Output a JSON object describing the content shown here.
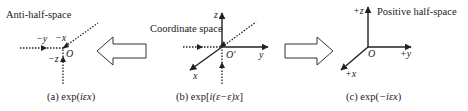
{
  "figure": {
    "panels": [
      {
        "id": "a",
        "title": "Anti-half-space",
        "origin_label": "O",
        "axis_labels": {
          "y": "−y",
          "x": "−x",
          "z": "−z"
        },
        "caption_prefix": "(a) exp(",
        "caption_math": "iεx",
        "caption_suffix": ")"
      },
      {
        "id": "b",
        "title": "Coordinate space",
        "origin_label": "O′",
        "axis_labels": {
          "z": "z",
          "y": "y",
          "x": "x"
        },
        "caption_prefix": "(b) exp[",
        "caption_math": "i(ε−ε)x",
        "caption_suffix": "]"
      },
      {
        "id": "c",
        "title": "Positive half-space",
        "origin_label": "O",
        "axis_labels": {
          "z": "+z",
          "y": "+y",
          "x": "+x"
        },
        "caption_prefix": "(c) exp(",
        "caption_math": "−iεx",
        "caption_suffix": ")"
      }
    ],
    "arrows": [
      {
        "direction": "left"
      },
      {
        "direction": "right"
      }
    ],
    "colors": {
      "line": "#222222",
      "background": "#ffffff"
    }
  }
}
